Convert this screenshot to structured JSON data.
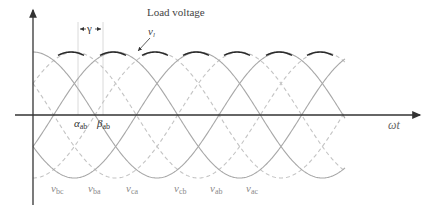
{
  "diagram": {
    "title": "Load voltage",
    "load_voltage_label": {
      "symbol": "v",
      "subscript": "l"
    },
    "overlap_label": "γ",
    "x_axis_label": "ωt",
    "angle_labels": [
      {
        "symbol": "α",
        "subscript": "ab"
      },
      {
        "symbol": "β",
        "subscript": "ab"
      }
    ],
    "phase_labels": [
      {
        "symbol": "v",
        "subscript": "bc"
      },
      {
        "symbol": "v",
        "subscript": "ba"
      },
      {
        "symbol": "v",
        "subscript": "ca"
      },
      {
        "symbol": "v",
        "subscript": "cb"
      },
      {
        "symbol": "v",
        "subscript": "ab"
      },
      {
        "symbol": "v",
        "subscript": "ac"
      }
    ],
    "colors": {
      "axis": "#333333",
      "solid_wave": "#a8a8a8",
      "dashed_wave": "#c4c4c4",
      "envelope": "#2a2a2a",
      "guide": "#d0d0d0"
    }
  },
  "waveforms": {
    "origin_x": 33,
    "center_y": 115,
    "amplitude_px": 63,
    "period_px": 248,
    "x_start": 33,
    "x_end": 345,
    "solid_phases_deg": [
      90,
      210,
      330
    ],
    "dashed_phases_deg": [
      30,
      150,
      270
    ],
    "envelope_peaks_x": [
      71,
      113,
      155,
      196,
      237,
      279,
      320
    ],
    "envelope_half_width_px": 13,
    "overlap_guides_x": [
      78,
      103
    ]
  }
}
